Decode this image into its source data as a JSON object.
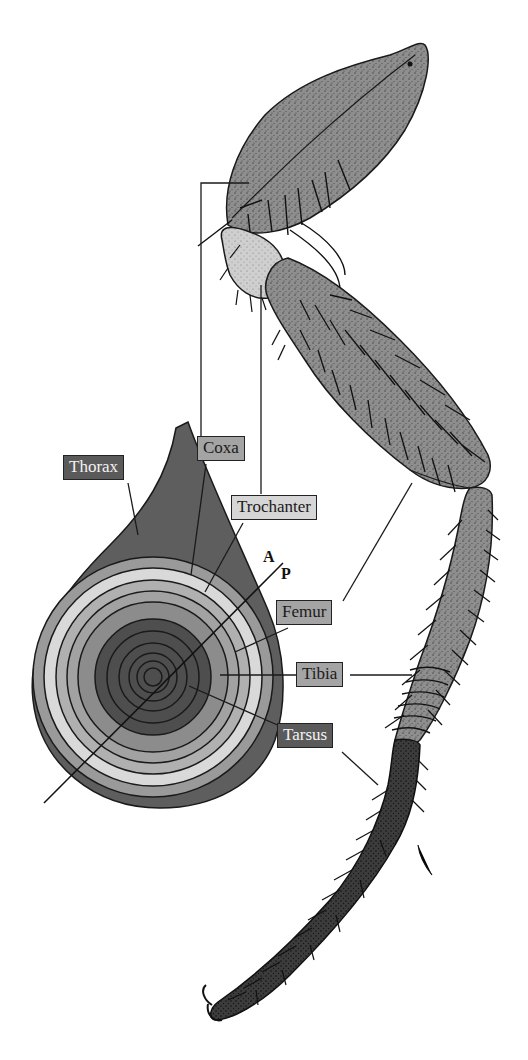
{
  "figure": {
    "labels": {
      "thorax": "Thorax",
      "coxa": "Coxa",
      "trochanter": "Trochanter",
      "femur": "Femur",
      "tibia": "Tibia",
      "tarsus": "Tarsus"
    },
    "axis": {
      "anterior": "A",
      "posterior": "P"
    },
    "colors": {
      "thorax": "#5e5e5e",
      "coxa_ring": "#9a9a9a",
      "trochanter_ring": "#d9d9d9",
      "femur_ring": "#b0b0b0",
      "tibia_ring": "#8c8c8c",
      "tarsus_core": "#4e4e4e",
      "leg_fill": "#8f8f8f",
      "outline": "#1a1a1a"
    }
  }
}
